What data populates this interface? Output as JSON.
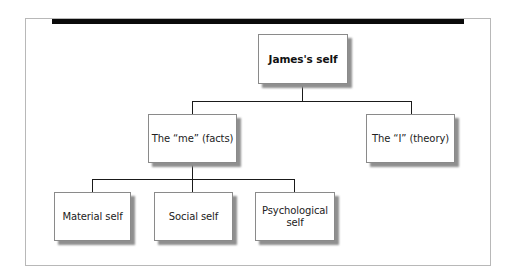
{
  "diagram": {
    "type": "tree",
    "root": {
      "label": "James's self"
    },
    "level1": [
      {
        "label": "The “me” (facts)"
      },
      {
        "label": "The “I” (theory)"
      }
    ],
    "level2": [
      {
        "label": "Material self",
        "parent": "The “me” (facts)"
      },
      {
        "label": "Social self",
        "parent": "The “me” (facts)"
      },
      {
        "label": "Psychological self",
        "parent": "The “me” (facts)"
      }
    ]
  },
  "colors": {
    "header_bar": "#0a0a0a",
    "frame_border": "#b8b8b8",
    "node_border": "#8a8a8a",
    "node_shadow": "#8f8f8f",
    "connector": "#1a1a1a"
  }
}
